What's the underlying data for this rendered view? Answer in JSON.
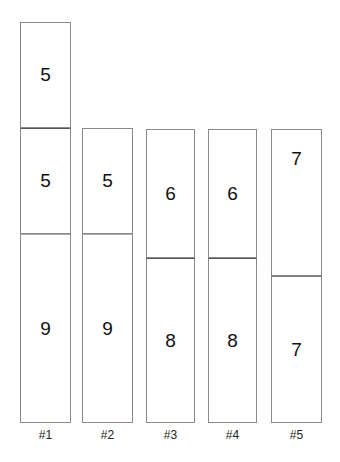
{
  "columns": [
    {
      "label": "#1",
      "segments": [
        5,
        5,
        9
      ]
    },
    {
      "label": "#2",
      "segments": [
        5,
        9
      ]
    },
    {
      "label": "#3",
      "segments": [
        6,
        8
      ]
    },
    {
      "label": "#4",
      "segments": [
        6,
        8
      ]
    },
    {
      "label": "#5",
      "segments": [
        7,
        7
      ]
    }
  ]
}
